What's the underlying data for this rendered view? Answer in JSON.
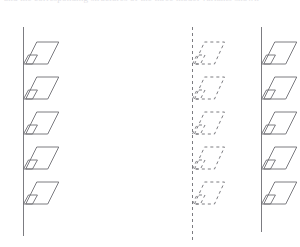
{
  "page": {
    "width": 300,
    "height": 247,
    "background_color": "#ffffff"
  },
  "header": {
    "clipped_text_line": "and the corresponding structures of the three model variants shown",
    "note": "faint partially cropped line of text across the very top edge"
  },
  "figure": {
    "title": "",
    "caption": "",
    "stroke_color": "#6d6d73",
    "stroke_width": 0.9,
    "fill": "none",
    "columns": [
      {
        "id": "left-strand",
        "label": "",
        "line_style": "solid",
        "axis_x": 23.5,
        "axis_top_y": 27,
        "axis_bottom_y": 236,
        "unit_count": 5,
        "unit_first_y": 42,
        "unit_spacing": 35,
        "unit": {
          "shape": "parallelogram-with-connector-tab",
          "width": 33,
          "height": 22,
          "skew_dx": 11,
          "tab_width": 9,
          "tab_height": 9
        }
      },
      {
        "id": "middle-strand",
        "label": "",
        "line_style": "dashed",
        "dash_pattern": "3,3",
        "axis_x": 192.5,
        "axis_top_y": 27,
        "axis_bottom_y": 241,
        "unit_count": 5,
        "unit_first_y": 42,
        "unit_spacing": 35,
        "unit": {
          "shape": "parallelogram-with-connector-tab",
          "width": 30,
          "height": 22,
          "skew_dx": 10,
          "tab_width": 8,
          "tab_height": 9
        }
      },
      {
        "id": "right-strand",
        "label": "",
        "line_style": "solid",
        "axis_x": 261.5,
        "axis_top_y": 27,
        "axis_bottom_y": 232,
        "unit_count": 5,
        "unit_first_y": 42,
        "unit_spacing": 35,
        "unit": {
          "shape": "parallelogram-with-connector-tab",
          "width": 33,
          "height": 22,
          "skew_dx": 11,
          "tab_width": 9,
          "tab_height": 9
        }
      }
    ]
  }
}
